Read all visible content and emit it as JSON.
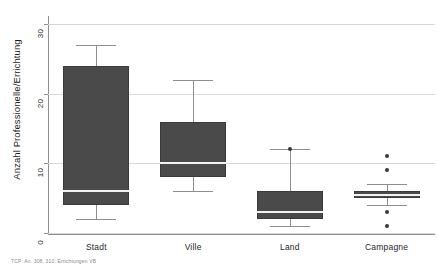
{
  "chart_data": {
    "type": "box",
    "title": "",
    "subtitle": "",
    "xlabel": "",
    "ylabel": "Anzahl Professionelle/Errichtung",
    "ylim": [
      0,
      30
    ],
    "yticks": [
      0,
      10,
      20,
      30
    ],
    "ytick_labels": [
      "0",
      "10",
      "20",
      "30"
    ],
    "grid": true,
    "legend": "none",
    "categories": [
      "Stadt",
      "Ville",
      "Land",
      "Campagne"
    ],
    "boxes": [
      {
        "category": "Stadt",
        "whisker_low": 2,
        "q1": 4,
        "median": 6,
        "q3": 24,
        "whisker_high": 27,
        "outliers": []
      },
      {
        "category": "Ville",
        "whisker_low": 6,
        "q1": 8,
        "median": 10,
        "q3": 16,
        "whisker_high": 22,
        "outliers": []
      },
      {
        "category": "Land",
        "whisker_low": 1,
        "q1": 2,
        "median": 3,
        "q3": 6,
        "whisker_high": 12,
        "outliers": [
          12
        ]
      },
      {
        "category": "Campagne",
        "whisker_low": 4,
        "q1": 5,
        "median": 5.5,
        "q3": 6,
        "whisker_high": 7,
        "outliers": [
          11,
          9,
          3,
          1
        ]
      }
    ]
  },
  "footnote": {
    "text": "TCP: An. 308, 310: Errichtungen VB"
  },
  "colors": {
    "box_fill": "#4a4a4a",
    "box_edge": "#3a3a3a",
    "median": "#f2f2f2",
    "whisker": "#8e8e8e",
    "grid": "#d8d8d8",
    "axis": "#8e8e8e",
    "text": "#1f1f1f",
    "footnote": "#8a8a8a",
    "background": "#ffffff"
  }
}
